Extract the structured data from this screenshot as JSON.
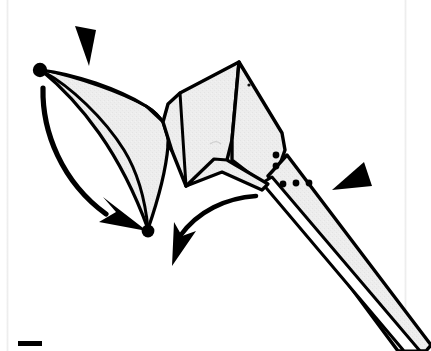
{
  "page": {
    "kind": "scanned-origami-instruction-diagram",
    "width": 431,
    "height": 351,
    "background_color": "#ffffff",
    "paper_fill_color": "#ececec",
    "ink_color": "#000000",
    "scan_edge_color": "#e2e2e2"
  },
  "diagram": {
    "title": "",
    "model_outline_label": "folded-paper-model",
    "labels": {
      "left_point_dot": "",
      "bottom_vertex_dot": "",
      "tail_spike": "",
      "body_panel": "",
      "left_wing_panel": ""
    }
  },
  "annotations": {
    "pointers": [
      {
        "name": "pointer-wedge-top",
        "kind": "solid-triangle-pointer",
        "direction": "down-left",
        "points_at": "left-point-tip",
        "label": ""
      },
      {
        "name": "pointer-wedge-right",
        "kind": "solid-triangle-pointer",
        "direction": "left",
        "points_at": "tail-fold-dots",
        "label": ""
      }
    ],
    "motion_arrows": [
      {
        "name": "fold-arrow-left",
        "kind": "curved-solid-arrow",
        "from": "left-point-tip",
        "to": "bottom-vertex",
        "direction": "down-right",
        "label": ""
      },
      {
        "name": "fold-arrow-center",
        "kind": "curved-open-arrow",
        "from": "tail-base",
        "to": "below-bottom-vertex",
        "direction": "down-left",
        "label": ""
      }
    ],
    "fold_dots": [
      {
        "name": "hidden-fold-dots-vertical",
        "count": 2,
        "orientation": "vertical"
      },
      {
        "name": "hidden-fold-dots-horizontal",
        "count": 3,
        "orientation": "horizontal"
      }
    ],
    "vertex_dots": [
      {
        "name": "vertex-dot-left-point"
      },
      {
        "name": "vertex-dot-bottom"
      }
    ],
    "page_marks": [
      {
        "name": "page-corner-bar",
        "label": ""
      }
    ]
  }
}
